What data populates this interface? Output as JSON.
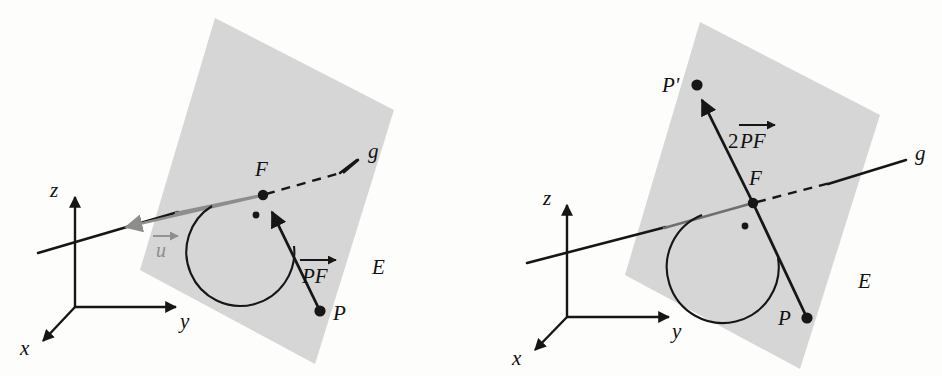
{
  "figure": {
    "colors": {
      "plane_fill": "#d6d6d6",
      "stroke_dark": "#161616",
      "vector_u_gray": "#8d8d8d",
      "background": "#fdfdfc"
    }
  },
  "panels": [
    {
      "id": "left",
      "name": "foot-of-perpendicular-diagram",
      "axes": {
        "x_label": "x",
        "y_label": "y",
        "z_label": "z"
      },
      "labels": {
        "plane": "E",
        "line": "g",
        "foot_point": "F",
        "point": "P",
        "direction_vector": "u",
        "vector_pf_prefix": "",
        "vector_pf": "PF"
      },
      "geometry": {
        "origin": [
          75,
          307
        ],
        "z_tip": [
          75,
          192
        ],
        "y_tip": [
          182,
          307
        ],
        "x_tip": [
          38,
          345
        ],
        "plane_corners": [
          [
            215,
            18
          ],
          [
            394,
            110
          ],
          [
            315,
            364
          ],
          [
            140,
            270
          ]
        ],
        "line_g_start": [
          38,
          253
        ],
        "line_g_end": [
          358,
          160
        ],
        "F": [
          263,
          195
        ],
        "P": [
          320,
          311
        ],
        "u_arrow_tip": [
          118,
          228
        ],
        "right_angle_dot": [
          256,
          215
        ]
      }
    },
    {
      "id": "right",
      "name": "reflected-point-diagram",
      "axes": {
        "x_label": "x",
        "y_label": "y",
        "z_label": "z"
      },
      "labels": {
        "plane": "E",
        "line": "g",
        "foot_point": "F",
        "point": "P",
        "reflected_point": "P'",
        "vector_prefix": "2",
        "vector_pf": "PF"
      },
      "geometry": {
        "origin": [
          567,
          317
        ],
        "z_tip": [
          567,
          200
        ],
        "y_tip": [
          675,
          317
        ],
        "x_tip": [
          530,
          354
        ],
        "plane_corners": [
          [
            700,
            22
          ],
          [
            880,
            115
          ],
          [
            800,
            369
          ],
          [
            625,
            275
          ]
        ],
        "line_g_start": [
          527,
          263
        ],
        "line_g_end": [
          906,
          165
        ],
        "F": [
          753,
          203
        ],
        "P": [
          807,
          318
        ],
        "P_prime": [
          697,
          85
        ],
        "right_angle_dot": [
          745,
          226
        ]
      }
    }
  ]
}
